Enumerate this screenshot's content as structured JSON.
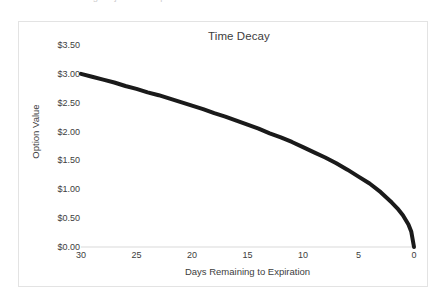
{
  "page": {
    "background_color": "#ffffff",
    "clipped_top_text": "a b c d e f g h i j k l m n o p"
  },
  "chart_frame": {
    "border_color": "#e3e3e3",
    "background_color": "#ffffff"
  },
  "chart_data": {
    "type": "line",
    "title": "Time Decay",
    "xlabel": "Days Remaining to Expiration",
    "ylabel": "Option Value",
    "xlim": [
      30,
      0
    ],
    "ylim": [
      0.0,
      3.5
    ],
    "x_reversed": true,
    "grid": false,
    "legend": null,
    "line_color": "#1a1a1a",
    "line_width": 4,
    "x_tick_labels": [
      "30",
      "25",
      "20",
      "15",
      "10",
      "5",
      "0"
    ],
    "x_tick_values": [
      30,
      25,
      20,
      15,
      10,
      5,
      0
    ],
    "y_tick_labels": [
      "$3.50",
      "$3.00",
      "$2.50",
      "$2.00",
      "$1.50",
      "$1.00",
      "$0.50",
      "$0.00"
    ],
    "y_tick_values": [
      3.5,
      3.0,
      2.5,
      2.0,
      1.5,
      1.0,
      0.5,
      0.0
    ],
    "series": [
      {
        "name": "Option Value",
        "x": [
          30,
          29,
          28,
          27,
          26,
          25,
          24,
          23,
          22,
          21,
          20,
          19,
          18,
          17,
          16,
          15,
          14,
          13,
          12,
          11,
          10,
          9,
          8,
          7,
          6,
          5,
          4,
          3,
          2,
          1.5,
          1,
          0.5,
          0.25,
          0
        ],
        "values": [
          3.0,
          2.95,
          2.9,
          2.85,
          2.79,
          2.74,
          2.68,
          2.63,
          2.57,
          2.51,
          2.45,
          2.39,
          2.32,
          2.26,
          2.19,
          2.12,
          2.05,
          1.97,
          1.9,
          1.82,
          1.73,
          1.64,
          1.55,
          1.45,
          1.34,
          1.22,
          1.1,
          0.95,
          0.77,
          0.67,
          0.55,
          0.39,
          0.27,
          0.0
        ]
      }
    ]
  }
}
